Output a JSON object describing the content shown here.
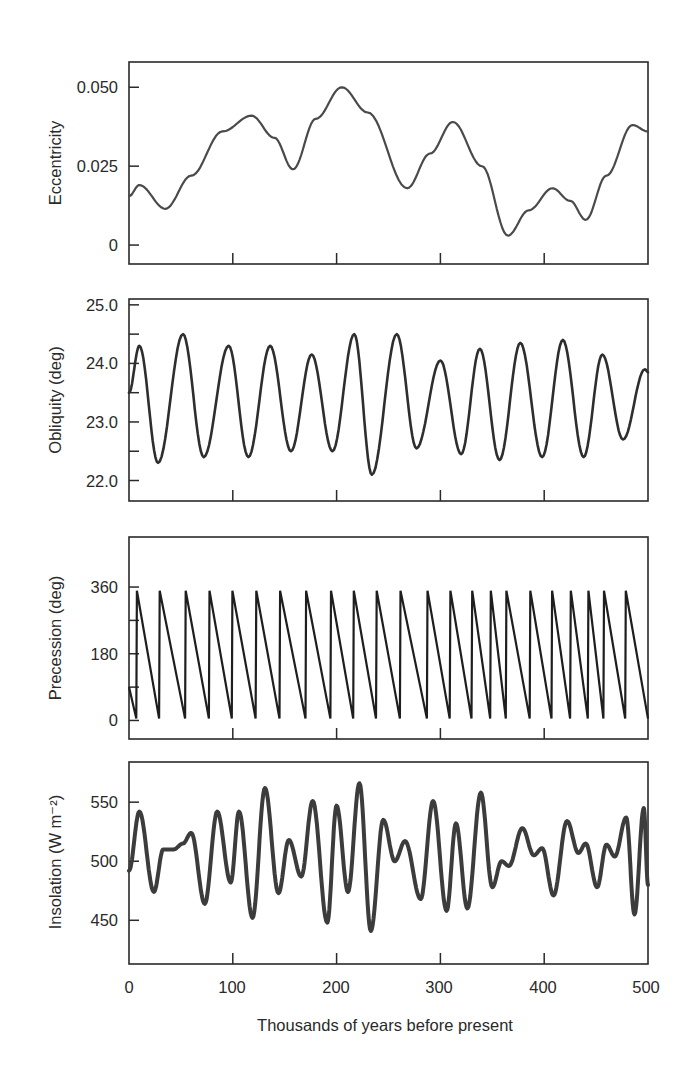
{
  "figure": {
    "xlabel": "Thousands of years before present",
    "x_tick_labels": [
      "0",
      "100",
      "200",
      "300",
      "400",
      "500"
    ]
  },
  "chart_data": [
    {
      "type": "line",
      "title": "",
      "xlabel": "Thousands of years before present",
      "ylabel": "Eccentricity",
      "xlim": [
        0,
        500
      ],
      "ylim": [
        -0.006,
        0.058
      ],
      "yticks": [
        0,
        0.025,
        0.05
      ],
      "ytick_labels": [
        "0",
        "0.025",
        "0.050"
      ],
      "grid": false,
      "line_color": "#4a4a4a",
      "line_width": 2.2,
      "x": [
        0,
        10,
        35,
        60,
        90,
        118,
        140,
        158,
        180,
        205,
        230,
        268,
        290,
        312,
        340,
        365,
        385,
        408,
        425,
        440,
        460,
        485,
        500
      ],
      "values": [
        0.0155,
        0.019,
        0.0115,
        0.022,
        0.036,
        0.041,
        0.034,
        0.024,
        0.04,
        0.05,
        0.042,
        0.018,
        0.029,
        0.039,
        0.025,
        0.003,
        0.011,
        0.018,
        0.014,
        0.008,
        0.022,
        0.038,
        0.036
      ]
    },
    {
      "type": "line",
      "title": "",
      "xlabel": "Thousands of years before present",
      "ylabel": "Obliquity (deg)",
      "xlim": [
        0,
        500
      ],
      "ylim": [
        21.65,
        25.1
      ],
      "yticks": [
        22.0,
        22.5,
        23.0,
        23.5,
        24.0,
        24.5,
        25.0
      ],
      "ytick_labels": [
        "22.0",
        "",
        "23.0",
        "",
        "24.0",
        "",
        "25.0"
      ],
      "grid": false,
      "line_color": "#2e2e2e",
      "line_width": 2.6,
      "x": [
        0,
        10,
        28,
        52,
        72,
        96,
        115,
        136,
        156,
        176,
        196,
        217,
        234,
        258,
        277,
        300,
        320,
        338,
        357,
        377,
        398,
        418,
        438,
        456,
        476,
        497,
        500
      ],
      "values": [
        23.5,
        24.3,
        22.3,
        24.5,
        22.4,
        24.3,
        22.4,
        24.3,
        22.5,
        24.15,
        22.5,
        24.5,
        22.1,
        24.5,
        22.55,
        24.05,
        22.45,
        24.25,
        22.35,
        24.35,
        22.4,
        24.4,
        22.4,
        24.15,
        22.7,
        23.9,
        23.85
      ]
    },
    {
      "type": "line",
      "title": "",
      "xlabel": "Thousands of years before present",
      "ylabel": "Precession (deg)",
      "xlim": [
        0,
        500
      ],
      "ylim": [
        -50,
        495
      ],
      "yticks": [
        0,
        90,
        180,
        270,
        360
      ],
      "ytick_labels": [
        "0",
        "",
        "180",
        "",
        "360"
      ],
      "grid": false,
      "line_color": "#1e1e1e",
      "line_width": 2.2,
      "reset_points_kyr": [
        7,
        29,
        54,
        77,
        99,
        122,
        145,
        170,
        194,
        216,
        238,
        261,
        287,
        309,
        330,
        348,
        363,
        386,
        407,
        425,
        442,
        457,
        478
      ],
      "start_value": 90,
      "max_value": 350,
      "min_value": 5,
      "end_value": 60
    },
    {
      "type": "line",
      "title": "",
      "xlabel": "Thousands of years before present",
      "ylabel": "Insolation (W m⁻²)",
      "xlim": [
        0,
        500
      ],
      "ylim": [
        413,
        584
      ],
      "yticks": [
        450,
        500,
        550
      ],
      "ytick_labels": [
        "450",
        "500",
        "550"
      ],
      "grid": false,
      "line_color": "#3c3c3c",
      "line_width": 4,
      "x": [
        0,
        10,
        24,
        33,
        43,
        52,
        60,
        73,
        85,
        98,
        106,
        119,
        131,
        144,
        154,
        166,
        177,
        191,
        200,
        211,
        222,
        233,
        245,
        256,
        266,
        281,
        293,
        306,
        315,
        326,
        339,
        350,
        359,
        366,
        379,
        390,
        398,
        409,
        422,
        433,
        440,
        451,
        460,
        468,
        479,
        487,
        496,
        500
      ],
      "values": [
        492,
        542,
        474,
        510,
        510,
        515,
        524,
        464,
        542,
        482,
        542,
        452,
        562,
        473,
        518,
        487,
        551,
        448,
        547,
        474,
        566,
        441,
        535,
        500,
        517,
        468,
        551,
        458,
        532,
        460,
        558,
        478,
        500,
        496,
        528,
        505,
        511,
        471,
        534,
        507,
        515,
        478,
        514,
        504,
        537,
        455,
        545,
        480
      ]
    }
  ]
}
